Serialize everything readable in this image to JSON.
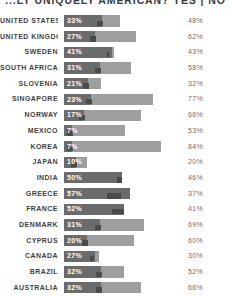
{
  "chart_data": {
    "type": "bar",
    "title": "...LY UNIQUELY AMERICAN? YES | NO",
    "xlabel": "",
    "ylabel": "",
    "xlim": [
      0,
      100
    ],
    "grid": false,
    "legend": [
      "YES",
      "NO"
    ],
    "legend_position": "title",
    "value_suffix": "%",
    "categories": [
      "UNITED STATES",
      "UNITED KINGDOM",
      "SWEDEN",
      "SOUTH AFRICA",
      "SLOVENIA",
      "SINGAPORE",
      "NORWAY",
      "MEXICO",
      "KOREA",
      "JAPAN",
      "INDIA",
      "GREECE",
      "FRANCE",
      "DENMARK",
      "CYPRUS",
      "CANADA",
      "BRAZIL",
      "AUSTRALIA"
    ],
    "series": [
      {
        "name": "YES",
        "color": "#6b6b6b",
        "values": [
          33,
          27,
          41,
          31,
          21,
          23,
          17,
          7,
          7,
          10,
          50,
          57,
          52,
          31,
          20,
          27,
          32,
          32
        ]
      },
      {
        "name": "NO",
        "color": "#9e9e9e",
        "values": [
          48,
          62,
          43,
          58,
          32,
          77,
          66,
          53,
          84,
          20,
          46,
          37,
          41,
          69,
          60,
          30,
          52,
          66
        ]
      }
    ],
    "rows": [
      {
        "label": "UNITED STATES",
        "yes": 33,
        "no": 48,
        "yes_label": "33%",
        "no_label": "48%"
      },
      {
        "label": "UNITED KINGDOM",
        "yes": 27,
        "no": 62,
        "yes_label": "27%",
        "no_label": "62%"
      },
      {
        "label": "SWEDEN",
        "yes": 41,
        "no": 43,
        "yes_label": "41%",
        "no_label": "43%"
      },
      {
        "label": "SOUTH AFRICA",
        "yes": 31,
        "no": 58,
        "yes_label": "31%",
        "no_label": "58%"
      },
      {
        "label": "SLOVENIA",
        "yes": 21,
        "no": 32,
        "yes_label": "21%",
        "no_label": "32%"
      },
      {
        "label": "SINGAPORE",
        "yes": 23,
        "no": 77,
        "yes_label": "23%",
        "no_label": "77%"
      },
      {
        "label": "NORWAY",
        "yes": 17,
        "no": 66,
        "yes_label": "17%",
        "no_label": "66%"
      },
      {
        "label": "MEXICO",
        "yes": 7,
        "no": 53,
        "yes_label": "7%",
        "no_label": "53%"
      },
      {
        "label": "KOREA",
        "yes": 7,
        "no": 84,
        "yes_label": "7%",
        "no_label": "84%"
      },
      {
        "label": "JAPAN",
        "yes": 10,
        "no": 20,
        "yes_label": "10%",
        "no_label": "20%"
      },
      {
        "label": "INDIA",
        "yes": 50,
        "no": 46,
        "yes_label": "50%",
        "no_label": "46%"
      },
      {
        "label": "GREECE",
        "yes": 57,
        "no": 37,
        "yes_label": "57%",
        "no_label": "37%"
      },
      {
        "label": "FRANCE",
        "yes": 52,
        "no": 41,
        "yes_label": "52%",
        "no_label": "41%"
      },
      {
        "label": "DENMARK",
        "yes": 31,
        "no": 69,
        "yes_label": "31%",
        "no_label": "69%"
      },
      {
        "label": "CYPRUS",
        "yes": 20,
        "no": 60,
        "yes_label": "20%",
        "no_label": "60%"
      },
      {
        "label": "CANADA",
        "yes": 27,
        "no": 30,
        "yes_label": "27%",
        "no_label": "30%"
      },
      {
        "label": "BRAZIL",
        "yes": 32,
        "no": 52,
        "yes_label": "32%",
        "no_label": "52%"
      },
      {
        "label": "AUSTRALIA",
        "yes": 32,
        "no": 66,
        "yes_label": "32%",
        "no_label": "66%"
      }
    ]
  },
  "colors": {
    "yes_bar": "#6b6b6b",
    "no_bar": "#9e9e9e",
    "label_text": "#3f3f3f",
    "right_value_text": "#6d6d6d",
    "background": "#ffffff"
  }
}
